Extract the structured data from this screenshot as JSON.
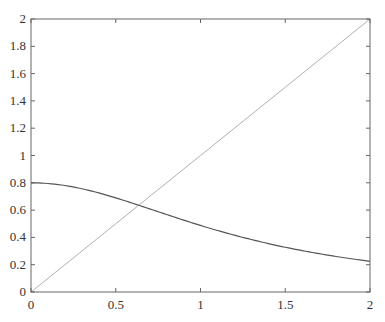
{
  "chart_data": {
    "type": "line",
    "title": "",
    "xlabel": "",
    "ylabel": "",
    "xlim": [
      0,
      2
    ],
    "ylim": [
      0,
      2
    ],
    "grid": false,
    "legend": null,
    "x_ticks": [
      "0",
      "0.5",
      "1",
      "1.5",
      "2"
    ],
    "y_ticks": [
      "0",
      "0.2",
      "0.4",
      "0.6",
      "0.8",
      "1",
      "1.2",
      "1.4",
      "1.6",
      "1.8",
      "2"
    ],
    "series": [
      {
        "name": "y = x",
        "color": "#b0b0b0",
        "x": [
          0,
          0.5,
          1,
          1.5,
          2
        ],
        "y": [
          0,
          0.5,
          1,
          1.5,
          2
        ]
      },
      {
        "name": "decaying curve",
        "color": "#555555",
        "x": [
          0,
          0.25,
          0.5,
          0.64,
          0.75,
          1,
          1.25,
          1.5,
          1.75,
          2
        ],
        "y": [
          0.8,
          0.77,
          0.69,
          0.63,
          0.59,
          0.49,
          0.4,
          0.33,
          0.27,
          0.22
        ]
      }
    ]
  }
}
